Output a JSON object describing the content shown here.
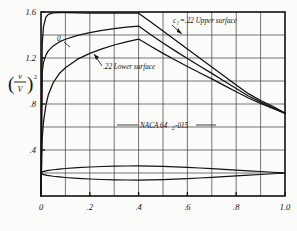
{
  "figure": {
    "background_color": "#fbfbf9",
    "ink_color": "#111111",
    "grid_color": "#3a3a3a"
  },
  "axes": {
    "x_title": "x/c",
    "y_title_numerator": "v",
    "y_title_denominator": "V",
    "y_title_exponent": "2",
    "x_tick_labels": [
      "0",
      ".2",
      ".4",
      ".6",
      ".8",
      "1.0"
    ],
    "x_tick_values": [
      0,
      0.2,
      0.4,
      0.6,
      0.8,
      1.0
    ],
    "y_tick_labels": [
      "1.6",
      "1.2",
      ".8",
      ".4"
    ],
    "y_tick_values": [
      1.6,
      1.2,
      0.8,
      0.4
    ]
  },
  "annotations": {
    "cl_zero_label": "0",
    "cl_symbol": "c",
    "cl_subscript": "l",
    "upper_surface_label": "=.22 Upper surface",
    "lower_surface_label": ".22 Lower surface",
    "airfoil_name_prefix": "NACA 64",
    "airfoil_name_subscript": "2",
    "airfoil_name_suffix": "-015"
  },
  "chart_data": {
    "type": "line",
    "xlabel": "x/c",
    "ylabel": "(v/V)²",
    "xlim": [
      0,
      1.0
    ],
    "ylim": [
      0,
      1.6
    ],
    "grid": true,
    "grid_x_step": 0.1,
    "grid_y_step": 0.2,
    "legend": "inline-annotations",
    "series": [
      {
        "name": "c_l = 0",
        "annotation": "0",
        "x": [
          0.0,
          0.005,
          0.01,
          0.02,
          0.03,
          0.05,
          0.075,
          0.1,
          0.15,
          0.2,
          0.25,
          0.3,
          0.35,
          0.4,
          0.45,
          0.5,
          0.55,
          0.6,
          0.65,
          0.7,
          0.75,
          0.8,
          0.85,
          0.9,
          0.95,
          1.0
        ],
        "y": [
          0.0,
          1.32,
          1.47,
          1.555,
          1.58,
          1.592,
          1.594,
          1.594,
          1.592,
          1.59,
          1.59,
          1.59,
          1.59,
          1.59,
          1.512,
          1.434,
          1.356,
          1.278,
          1.2,
          1.122,
          1.044,
          0.966,
          0.89,
          0.83,
          0.78,
          0.722
        ]
      },
      {
        "name": "c_l = .22 Upper surface",
        "annotation": "c_l =.22 Upper surface",
        "x": [
          0.0,
          0.005,
          0.01,
          0.02,
          0.03,
          0.05,
          0.075,
          0.1,
          0.15,
          0.2,
          0.25,
          0.3,
          0.35,
          0.4,
          0.45,
          0.5,
          0.55,
          0.6,
          0.65,
          0.7,
          0.75,
          0.8,
          0.85,
          0.9,
          0.95,
          1.0
        ],
        "y": [
          0.0,
          1.08,
          1.16,
          1.225,
          1.262,
          1.305,
          1.34,
          1.363,
          1.397,
          1.42,
          1.44,
          1.455,
          1.468,
          1.478,
          1.402,
          1.33,
          1.262,
          1.196,
          1.13,
          1.066,
          1.0,
          0.934,
          0.87,
          0.818,
          0.77,
          0.72
        ]
      },
      {
        "name": "c_l = .22 Lower surface",
        "annotation": ".22 Lower surface",
        "x": [
          0.0,
          0.005,
          0.01,
          0.02,
          0.03,
          0.05,
          0.075,
          0.1,
          0.15,
          0.2,
          0.25,
          0.3,
          0.35,
          0.4,
          0.45,
          0.5,
          0.55,
          0.6,
          0.65,
          0.7,
          0.75,
          0.8,
          0.85,
          0.9,
          0.95,
          1.0
        ],
        "y": [
          0.0,
          0.5,
          0.64,
          0.79,
          0.88,
          0.985,
          1.065,
          1.115,
          1.19,
          1.24,
          1.28,
          1.313,
          1.34,
          1.365,
          1.302,
          1.24,
          1.182,
          1.126,
          1.072,
          1.018,
          0.962,
          0.906,
          0.852,
          0.806,
          0.762,
          0.718
        ]
      }
    ],
    "airfoil_profile": {
      "name": "NACA 64₂-015",
      "thickness_ratio": 0.15,
      "baseline_y": 0.2,
      "y_scale": 0.8,
      "x": [
        0.0,
        0.005,
        0.0075,
        0.0125,
        0.025,
        0.05,
        0.075,
        0.1,
        0.15,
        0.2,
        0.25,
        0.3,
        0.35,
        0.4,
        0.45,
        0.5,
        0.55,
        0.6,
        0.65,
        0.7,
        0.75,
        0.8,
        0.85,
        0.9,
        0.95,
        1.0
      ],
      "half_thickness": [
        0.0,
        0.012,
        0.0146,
        0.0186,
        0.0257,
        0.0355,
        0.0429,
        0.0489,
        0.0584,
        0.0654,
        0.0706,
        0.0742,
        0.0762,
        0.0766,
        0.075,
        0.0716,
        0.0668,
        0.061,
        0.0544,
        0.0472,
        0.0396,
        0.0318,
        0.0239,
        0.0161,
        0.0082,
        0.0008
      ]
    }
  }
}
